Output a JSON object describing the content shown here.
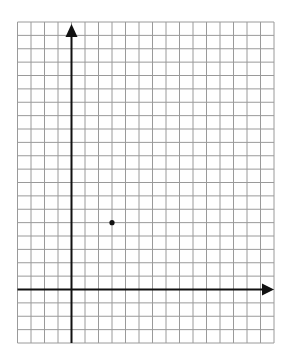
{
  "chart_data": {
    "type": "scatter",
    "title": "",
    "xlabel": "",
    "ylabel": "",
    "grid": true,
    "xlim": [
      -4,
      15
    ],
    "ylim": [
      -4,
      20
    ],
    "axes": {
      "x_arrow": "right",
      "y_arrow": "up"
    },
    "points": [
      {
        "x": 3,
        "y": 5
      }
    ],
    "colors": {
      "grid": "#9a9a9a",
      "axis": "#111111",
      "point": "#111111",
      "background": "#ffffff"
    }
  }
}
